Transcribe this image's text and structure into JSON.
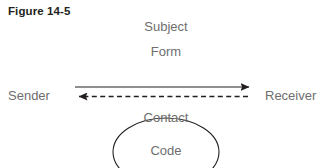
{
  "figure": {
    "title": "Figure 14-5",
    "background_color": "#ffffff",
    "title_color": "#231f20",
    "label_color": "#6e6e6e",
    "line_color": "#231f20"
  },
  "labels": {
    "subject": "Subject",
    "form": "Form",
    "sender": "Sender",
    "receiver": "Receiver",
    "contact": "Contact",
    "code": "Code"
  },
  "connectors": [
    {
      "name": "sender-to-receiver-arrow",
      "style": "solid",
      "direction": "right",
      "from_x": 75,
      "to_x": 250,
      "y": 87
    },
    {
      "name": "receiver-to-sender-arrow",
      "style": "dashed",
      "direction": "left",
      "from_x": 248,
      "to_x": 78,
      "y": 96
    }
  ],
  "shapes": [
    {
      "name": "code-ellipse",
      "type": "ellipse",
      "center_x": 166,
      "center_y": 152,
      "radius_x": 53,
      "radius_y": 34,
      "clipped_bottom": true
    }
  ]
}
